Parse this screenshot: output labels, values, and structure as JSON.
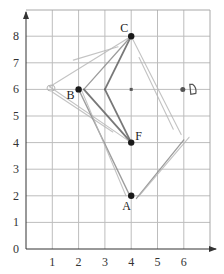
{
  "figure": {
    "type": "coordinate-grid-diagram",
    "x_axis": {
      "min": 0,
      "max": 6,
      "tick_labels": [
        "1",
        "2",
        "3",
        "4",
        "5",
        "6"
      ]
    },
    "y_axis": {
      "min": 0,
      "max": 8,
      "tick_labels": [
        "0",
        "1",
        "2",
        "3",
        "4",
        "5",
        "6",
        "7",
        "8"
      ]
    },
    "colors": {
      "grid": "#bdbdbd",
      "axis": "#333333",
      "point": "#1a1a1a",
      "stroke_dark": "#6a6a6a",
      "stroke_light": "#b5b5b5"
    }
  },
  "points": [
    {
      "label": "A",
      "x": 4,
      "y": 2,
      "style": "filled"
    },
    {
      "label": "B",
      "x": 2,
      "y": 6,
      "style": "filled"
    },
    {
      "label": "C",
      "x": 4,
      "y": 8,
      "style": "filled"
    },
    {
      "label": "D",
      "x": 6,
      "y": 6,
      "style": "handwritten"
    },
    {
      "label": "F",
      "x": 4,
      "y": 4,
      "style": "filled"
    }
  ],
  "small_markers": [
    {
      "x": 4,
      "y": 6
    }
  ],
  "strokes": [
    {
      "from": [
        4,
        8
      ],
      "to": [
        3,
        6
      ],
      "weight": "dark"
    },
    {
      "from": [
        3,
        6
      ],
      "to": [
        4,
        4
      ],
      "weight": "dark"
    },
    {
      "from": [
        4,
        8
      ],
      "to": [
        2.2,
        6
      ],
      "weight": "medium"
    },
    {
      "from": [
        2.2,
        6
      ],
      "to": [
        4,
        4
      ],
      "weight": "dark"
    },
    {
      "from": [
        4,
        8
      ],
      "to": [
        0.9,
        6.1
      ],
      "weight": "light"
    },
    {
      "from": [
        0.9,
        6.1
      ],
      "to": [
        4,
        4
      ],
      "weight": "light"
    },
    {
      "from": [
        1,
        5.9
      ],
      "to": [
        3.3,
        4.4
      ],
      "weight": "light"
    },
    {
      "from": [
        4,
        8
      ],
      "to": [
        5.9,
        4.3
      ],
      "weight": "light"
    },
    {
      "from": [
        2,
        6
      ],
      "to": [
        3.9,
        2.1
      ],
      "weight": "medium"
    },
    {
      "from": [
        2.1,
        6
      ],
      "to": [
        3.8,
        2
      ],
      "weight": "light"
    },
    {
      "from": [
        4.2,
        1.9
      ],
      "to": [
        6,
        4.1
      ],
      "weight": "medium"
    },
    {
      "from": [
        4.3,
        2
      ],
      "to": [
        6.2,
        4.2
      ],
      "weight": "light"
    },
    {
      "from": [
        1.8,
        7.1
      ],
      "to": [
        3.5,
        7.6
      ],
      "weight": "light"
    },
    {
      "from": [
        4.3,
        7.2
      ],
      "to": [
        5.6,
        4.5
      ],
      "weight": "light"
    }
  ],
  "chart_data": {
    "type": "scatter",
    "title": "",
    "xlabel": "",
    "ylabel": "",
    "xlim": [
      0,
      7
    ],
    "ylim": [
      0,
      9
    ],
    "grid": true,
    "x_ticks": [
      1,
      2,
      3,
      4,
      5,
      6
    ],
    "y_ticks": [
      0,
      1,
      2,
      3,
      4,
      5,
      6,
      7,
      8
    ],
    "series": [
      {
        "name": "points",
        "labels": [
          "A",
          "B",
          "C",
          "D",
          "F"
        ],
        "x": [
          4,
          2,
          4,
          6,
          4
        ],
        "y": [
          2,
          6,
          8,
          6,
          4
        ]
      }
    ],
    "annotations": [
      "A",
      "B",
      "C",
      "D",
      "F"
    ]
  }
}
